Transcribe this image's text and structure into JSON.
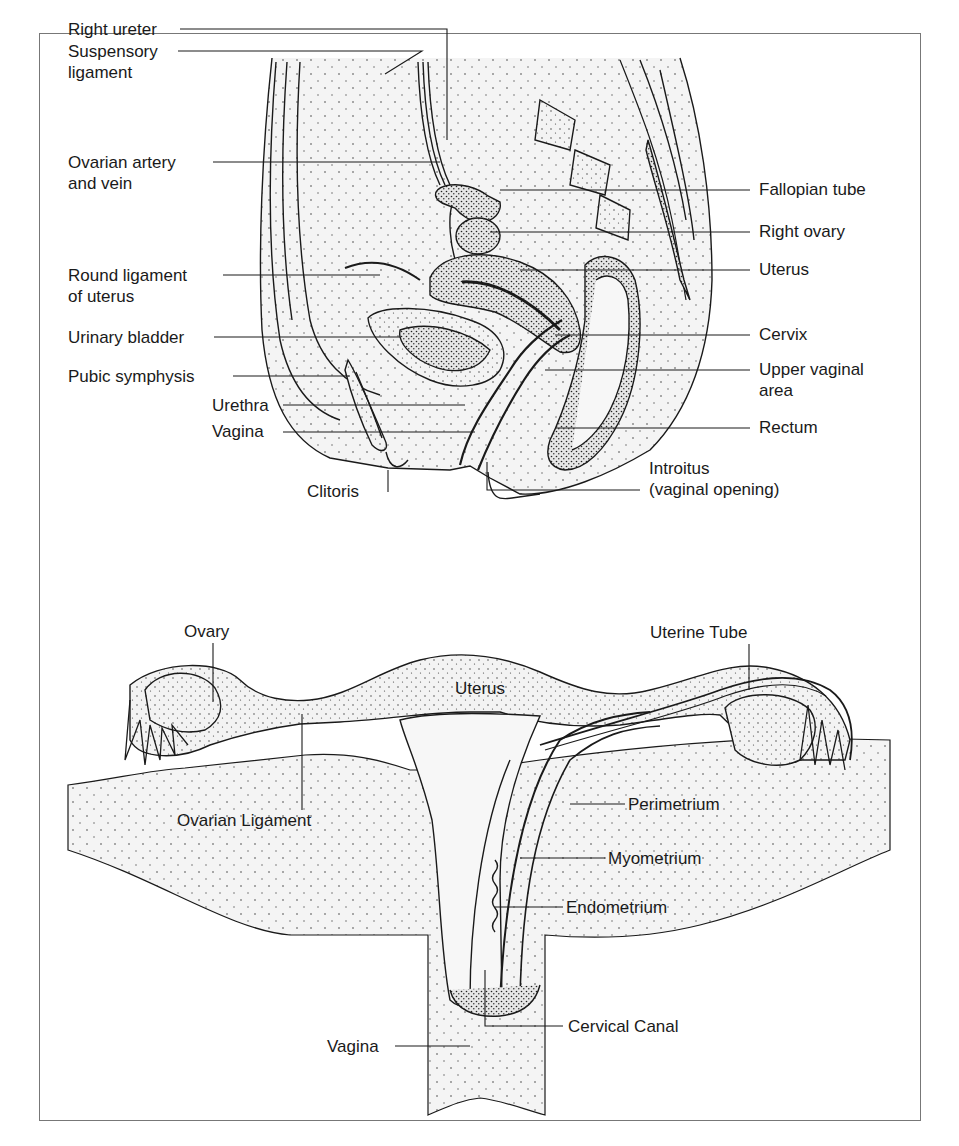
{
  "figure": {
    "sagittal_view": {
      "left_labels": [
        {
          "id": "right-ureter",
          "lines": [
            "Right ureter"
          ]
        },
        {
          "id": "suspensory-ligament",
          "lines": [
            "Suspensory",
            "ligament"
          ]
        },
        {
          "id": "ovarian-artery-vein",
          "lines": [
            "Ovarian artery",
            "and vein"
          ]
        },
        {
          "id": "round-ligament",
          "lines": [
            "Round ligament",
            "of uterus"
          ]
        },
        {
          "id": "urinary-bladder",
          "lines": [
            "Urinary bladder"
          ]
        },
        {
          "id": "pubic-symphysis",
          "lines": [
            "Pubic symphysis"
          ]
        },
        {
          "id": "urethra",
          "lines": [
            "Urethra"
          ]
        },
        {
          "id": "vagina",
          "lines": [
            "Vagina"
          ]
        },
        {
          "id": "clitoris",
          "lines": [
            "Clitoris"
          ]
        }
      ],
      "right_labels": [
        {
          "id": "fallopian-tube",
          "lines": [
            "Fallopian tube"
          ]
        },
        {
          "id": "right-ovary",
          "lines": [
            "Right ovary"
          ]
        },
        {
          "id": "uterus",
          "lines": [
            "Uterus"
          ]
        },
        {
          "id": "cervix",
          "lines": [
            "Cervix"
          ]
        },
        {
          "id": "upper-vaginal-area",
          "lines": [
            "Upper vaginal",
            "area"
          ]
        },
        {
          "id": "rectum",
          "lines": [
            "Rectum"
          ]
        },
        {
          "id": "introitus",
          "lines": [
            "Introitus",
            "(vaginal opening)"
          ]
        }
      ]
    },
    "frontal_view": {
      "labels": [
        {
          "id": "ovary",
          "lines": [
            "Ovary"
          ]
        },
        {
          "id": "uterine-tube",
          "lines": [
            "Uterine Tube"
          ]
        },
        {
          "id": "uterus",
          "lines": [
            "Uterus"
          ]
        },
        {
          "id": "ovarian-ligament",
          "lines": [
            "Ovarian Ligament"
          ]
        },
        {
          "id": "perimetrium",
          "lines": [
            "Perimetrium"
          ]
        },
        {
          "id": "myometrium",
          "lines": [
            "Myometrium"
          ]
        },
        {
          "id": "endometrium",
          "lines": [
            "Endometrium"
          ]
        },
        {
          "id": "cervical-canal",
          "lines": [
            "Cervical Canal"
          ]
        },
        {
          "id": "vagina",
          "lines": [
            "Vagina"
          ]
        }
      ]
    },
    "colors": {
      "ink": "#1a1a1a",
      "frame": "#777777",
      "background": "#ffffff",
      "tissue_fill": "#f1f1f1"
    }
  }
}
